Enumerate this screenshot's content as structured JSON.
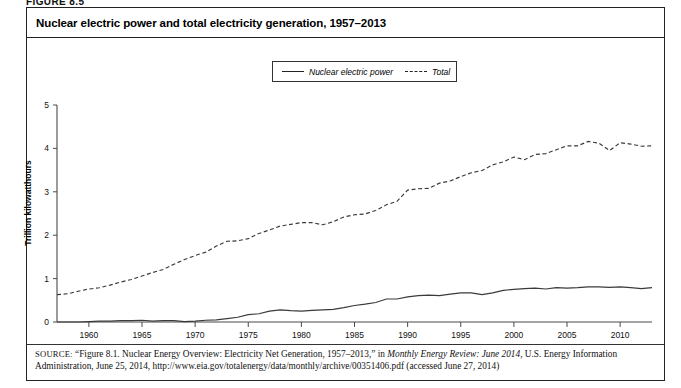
{
  "figure_label": "FIGURE 8.5",
  "chart_title": "Nuclear electric power and total electricity generation, 1957–2013",
  "legend": {
    "entries": [
      {
        "label": "Nuclear electric power",
        "style": "solid"
      },
      {
        "label": "Total",
        "style": "dashed"
      }
    ]
  },
  "source": {
    "label": "SOURCE:",
    "text_before_italic": " “Figure 8.1. Nuclear Energy Overview: Electricity Net Generation, 1957–2013,” in ",
    "italic_title": "Monthly Energy Review: June 2014",
    "text_after_italic": ", U.S. Energy Information Administration, June 25, 2014, http://www.eia.gov/totalenergy/data/monthly/archive/00351406.pdf (accessed June 27, 2014)"
  },
  "chart_data": {
    "type": "line",
    "title": "Nuclear electric power and total electricity generation, 1957–2013",
    "xlabel": "",
    "ylabel": "Trillion kilowatthours",
    "xlim": [
      1957,
      2013
    ],
    "ylim": [
      0,
      5
    ],
    "grid": false,
    "legend_position": "top-center",
    "x_ticks": [
      1960,
      1965,
      1970,
      1975,
      1980,
      1985,
      1990,
      1995,
      2000,
      2005,
      2010
    ],
    "y_ticks": [
      0,
      1,
      2,
      3,
      4,
      5
    ],
    "x": [
      1957,
      1958,
      1959,
      1960,
      1961,
      1962,
      1963,
      1964,
      1965,
      1966,
      1967,
      1968,
      1969,
      1970,
      1971,
      1972,
      1973,
      1974,
      1975,
      1976,
      1977,
      1978,
      1979,
      1980,
      1981,
      1982,
      1983,
      1984,
      1985,
      1986,
      1987,
      1988,
      1989,
      1990,
      1991,
      1992,
      1993,
      1994,
      1995,
      1996,
      1997,
      1998,
      1999,
      2000,
      2001,
      2002,
      2003,
      2004,
      2005,
      2006,
      2007,
      2008,
      2009,
      2010,
      2011,
      2012,
      2013
    ],
    "series": [
      {
        "name": "Nuclear electric power",
        "style": "solid",
        "values": [
          0.0,
          0.0,
          0.0,
          0.01,
          0.02,
          0.02,
          0.03,
          0.03,
          0.04,
          0.02,
          0.03,
          0.03,
          0.01,
          0.02,
          0.04,
          0.05,
          0.08,
          0.11,
          0.17,
          0.19,
          0.25,
          0.28,
          0.26,
          0.25,
          0.27,
          0.28,
          0.29,
          0.33,
          0.38,
          0.41,
          0.45,
          0.53,
          0.53,
          0.58,
          0.61,
          0.62,
          0.61,
          0.64,
          0.67,
          0.67,
          0.63,
          0.67,
          0.73,
          0.75,
          0.77,
          0.78,
          0.76,
          0.79,
          0.78,
          0.79,
          0.81,
          0.81,
          0.8,
          0.81,
          0.79,
          0.77,
          0.79
        ]
      },
      {
        "name": "Total",
        "style": "dashed",
        "values": [
          0.63,
          0.65,
          0.71,
          0.76,
          0.79,
          0.85,
          0.92,
          0.98,
          1.06,
          1.14,
          1.21,
          1.33,
          1.44,
          1.53,
          1.61,
          1.75,
          1.86,
          1.87,
          1.92,
          2.04,
          2.12,
          2.21,
          2.25,
          2.29,
          2.29,
          2.24,
          2.31,
          2.42,
          2.47,
          2.49,
          2.57,
          2.7,
          2.78,
          3.04,
          3.07,
          3.08,
          3.2,
          3.25,
          3.35,
          3.44,
          3.49,
          3.62,
          3.69,
          3.8,
          3.74,
          3.86,
          3.88,
          3.97,
          4.06,
          4.06,
          4.16,
          4.12,
          3.95,
          4.13,
          4.1,
          4.05,
          4.06
        ]
      }
    ]
  }
}
